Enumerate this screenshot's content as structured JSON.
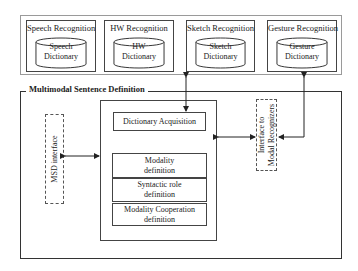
{
  "recognizers": [
    {
      "title": "Speech Recognition",
      "dictionary": [
        "Speech",
        "Dictionary"
      ]
    },
    {
      "title": "HW Recognition",
      "dictionary": [
        "HW",
        "Dictionary"
      ]
    },
    {
      "title": "Sketch Recognition",
      "dictionary": [
        "Sketch",
        "Dictionary"
      ]
    },
    {
      "title": "Gesture Recognition",
      "dictionary": [
        "Gesture",
        "Dictionary"
      ]
    }
  ],
  "main": {
    "title": "Multimodal Sentence Definition",
    "msd_interface": "MSD interface",
    "modal_interface": [
      "Interface to",
      "Modal Recognizers"
    ],
    "dictionary_acquisition": "Dictionary Acquisition",
    "definitions": [
      [
        "Modality",
        "definition"
      ],
      [
        "Syntactic role",
        "definition"
      ],
      [
        "Modality Cooperation",
        "definition"
      ]
    ]
  },
  "colors": {
    "line": "#333333",
    "outer_border": "#9a9a9a",
    "background": "#ffffff"
  }
}
